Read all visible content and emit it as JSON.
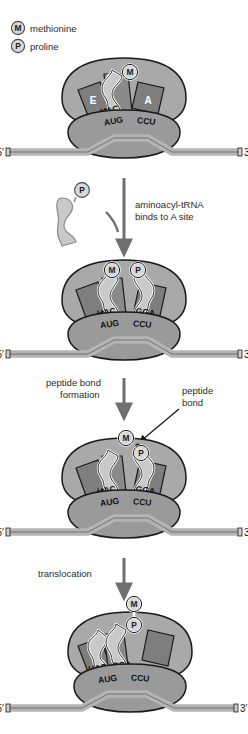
{
  "figure": {
    "legend": [
      {
        "symbol": "M",
        "label": "methionine"
      },
      {
        "symbol": "P",
        "label": "proline"
      }
    ],
    "colors": {
      "ribosome_large": "#a9a9a9",
      "ribosome_large_dark": "#8e8e8e",
      "ribosome_small": "#9a9a9a",
      "site_block": "#7e7e7e",
      "trna": "#c9c9c9",
      "mrna": "#b4b4b4",
      "outline": "#1a1a1a",
      "text": "#2b2b2b",
      "aa_circle": "#d8d8d8"
    },
    "mrna_labels": {
      "five_prime": "5′",
      "three_prime": "3′"
    },
    "site_labels": {
      "e": "E",
      "p": "P",
      "a": "A"
    },
    "steps": [
      {
        "id": "step-1",
        "name": "initiation-complex",
        "site_labels_shown": [
          "P",
          "E",
          "A"
        ],
        "trnas": [
          {
            "site": "P",
            "anticodon": "UAC",
            "amino_acid": "M"
          }
        ],
        "codons": [
          "AUG",
          "CCU"
        ],
        "amino_acid_chain": [
          "M"
        ]
      },
      {
        "id": "step-2",
        "name": "aminoacyl-trna-bound",
        "trnas": [
          {
            "site": "P",
            "anticodon": "UAC",
            "amino_acid": "M"
          },
          {
            "site": "A",
            "anticodon": "GGA",
            "amino_acid": "P"
          }
        ],
        "codons": [
          "AUG",
          "CCU"
        ],
        "amino_acid_chain": [
          "M",
          "P"
        ]
      },
      {
        "id": "step-3",
        "name": "peptide-bond-formed",
        "trnas": [
          {
            "site": "P",
            "anticodon": "UAC",
            "amino_acid": ""
          },
          {
            "site": "A",
            "anticodon": "GGA",
            "amino_acid": "P"
          }
        ],
        "codons": [
          "AUG",
          "CCU"
        ],
        "amino_acid_chain": [
          "M",
          "P"
        ],
        "annotation": "peptide bond"
      },
      {
        "id": "step-4",
        "name": "translocated",
        "trnas": [
          {
            "site": "E",
            "anticodon": "UAC",
            "amino_acid": ""
          },
          {
            "site": "P",
            "anticodon": "GGA",
            "amino_acid": "P"
          }
        ],
        "codons": [
          "AUG",
          "CCU"
        ],
        "amino_acid_chain": [
          "M",
          "P"
        ]
      }
    ],
    "transitions": [
      {
        "id": "transition-1",
        "label_line1": "aminoacyl-tRNA",
        "label_line2": "binds to A site",
        "incoming_trna": {
          "amino_acid": "P"
        }
      },
      {
        "id": "transition-2",
        "label_line1": "peptide bond",
        "label_line2": "formation",
        "callout_line1": "peptide",
        "callout_line2": "bond"
      },
      {
        "id": "transition-3",
        "label_line1": "translocation",
        "label_line2": ""
      }
    ]
  }
}
